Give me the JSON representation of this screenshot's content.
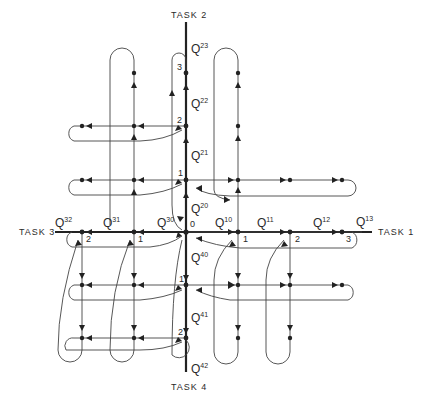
{
  "diagram": {
    "axes": {
      "task1": {
        "label": "TASK 1",
        "direction": "right"
      },
      "task2": {
        "label": "TASK 2",
        "direction": "up"
      },
      "task3": {
        "label": "TASK 3",
        "direction": "left"
      },
      "task4": {
        "label": "TASK 4",
        "direction": "down"
      }
    },
    "origin_label": "0",
    "node_labels": {
      "task1": [
        "1",
        "2",
        "3"
      ],
      "task2": [
        "1",
        "2",
        "3"
      ],
      "task3": [
        "1",
        "2"
      ],
      "task4": [
        "1",
        "2"
      ]
    },
    "state_labels": {
      "task1": [
        {
          "base": "Q",
          "sup": "10"
        },
        {
          "base": "Q",
          "sup": "11"
        },
        {
          "base": "Q",
          "sup": "12"
        },
        {
          "base": "Q",
          "sup": "13"
        }
      ],
      "task2": [
        {
          "base": "Q",
          "sup": "20"
        },
        {
          "base": "Q",
          "sup": "21"
        },
        {
          "base": "Q",
          "sup": "22"
        },
        {
          "base": "Q",
          "sup": "23"
        }
      ],
      "task3": [
        {
          "base": "Q",
          "sup": "30"
        },
        {
          "base": "Q",
          "sup": "31"
        },
        {
          "base": "Q",
          "sup": "32"
        }
      ],
      "task4": [
        {
          "base": "Q",
          "sup": "40"
        },
        {
          "base": "Q",
          "sup": "41"
        },
        {
          "base": "Q",
          "sup": "42"
        }
      ]
    },
    "colors": {
      "ink": "#222222",
      "background": "#ffffff"
    }
  }
}
